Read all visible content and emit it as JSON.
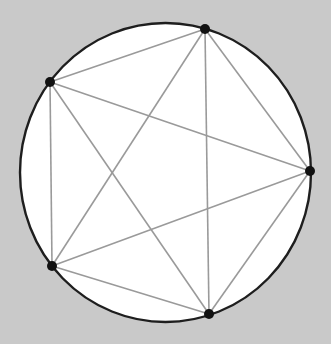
{
  "diagram": {
    "type": "complete-graph-on-circle",
    "colors": {
      "background": "#c9c9c9",
      "circle_fill": "#ffffff",
      "circle_stroke": "#1e1e1e",
      "chord_stroke": "#9a9a9a",
      "point_fill": "#111111"
    },
    "circle": {
      "cx": 165.5,
      "cy": 172.5,
      "rx": 145.5,
      "ry": 149.5
    },
    "points": [
      {
        "id": "A",
        "x": 205,
        "y": 29
      },
      {
        "id": "B",
        "x": 50,
        "y": 82
      },
      {
        "id": "C",
        "x": 52,
        "y": 266
      },
      {
        "id": "D",
        "x": 209,
        "y": 314
      },
      {
        "id": "E",
        "x": 310,
        "y": 171
      }
    ],
    "edges": [
      [
        "A",
        "B"
      ],
      [
        "A",
        "C"
      ],
      [
        "A",
        "D"
      ],
      [
        "A",
        "E"
      ],
      [
        "B",
        "C"
      ],
      [
        "B",
        "D"
      ],
      [
        "B",
        "E"
      ],
      [
        "C",
        "D"
      ],
      [
        "C",
        "E"
      ],
      [
        "D",
        "E"
      ]
    ]
  }
}
